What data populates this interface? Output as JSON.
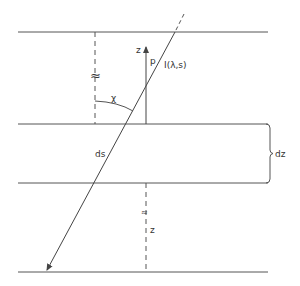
{
  "diagram": {
    "type": "radiative-transfer-slab-geometry",
    "colors": {
      "line": "#444444",
      "background": "#ffffff"
    },
    "labels": {
      "z_axis": "z",
      "p": "p",
      "intensity": "I(λ,s)",
      "chi": "χ",
      "ds": "ds",
      "dz": "dz",
      "approx_upper": "≈",
      "approx_lower": "≈",
      "z_lower": "z"
    },
    "elements": [
      "top boundary line",
      "layer top boundary",
      "layer bottom boundary",
      "bottom boundary line",
      "slanted ray path with arrow",
      "vertical z arrow",
      "angle arc chi",
      "brace dz",
      "dashed vertical upper",
      "dashed vertical lower"
    ]
  }
}
